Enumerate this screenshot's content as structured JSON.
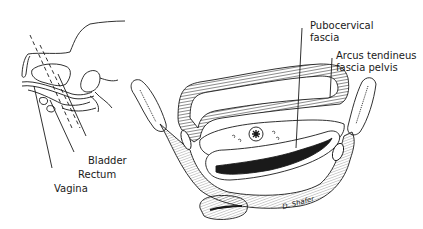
{
  "figure": {
    "type": "anatomical-illustration",
    "background": "#ffffff",
    "ink": "#1a1a1a"
  },
  "inset": {
    "labels": {
      "bladder": "Bladder",
      "rectum": "Rectum",
      "vagina": "Vagina"
    }
  },
  "cross_section": {
    "labels": {
      "pubocervical_line1": "Pubocervical",
      "pubocervical_line2": "fascia",
      "arcus_line1": "Arcus tendineus",
      "arcus_line2": "fascia pelvis"
    },
    "signature": "D. Shafer"
  }
}
